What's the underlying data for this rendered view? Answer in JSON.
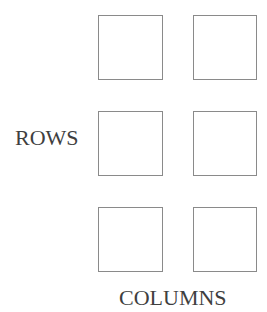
{
  "diagram": {
    "row_label": "ROWS",
    "column_label": "COLUMNS",
    "grid": {
      "rows": 3,
      "columns": 2,
      "cells": [
        {
          "row": 1,
          "col": 1
        },
        {
          "row": 1,
          "col": 2
        },
        {
          "row": 2,
          "col": 1
        },
        {
          "row": 2,
          "col": 2
        },
        {
          "row": 3,
          "col": 1
        },
        {
          "row": 3,
          "col": 2
        }
      ]
    },
    "colors": {
      "cell_border": "#8a8a8a",
      "text": "#3f3f3f",
      "background": "#ffffff"
    }
  }
}
